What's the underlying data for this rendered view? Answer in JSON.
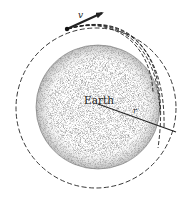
{
  "diagram": {
    "labels": {
      "earth": "Earth",
      "velocity": "v",
      "radius": "r"
    },
    "colors": {
      "ink": "#222222",
      "earth_stipple": "#555555",
      "background": "#ffffff"
    },
    "elements": {
      "earth_circle": {
        "cx": 98,
        "cy": 107,
        "r": 62
      },
      "orbit_circle": {
        "cx": 96,
        "cy": 108,
        "r": 80,
        "style": "dashed"
      },
      "projectile": {
        "x": 67,
        "y": 29
      },
      "velocity_arrow": {
        "from": [
          67,
          29
        ],
        "to": [
          104,
          12
        ]
      },
      "radius_line": {
        "from": [
          98,
          104
        ],
        "to": [
          176,
          132
        ]
      },
      "trajectory_count": 4
    }
  }
}
